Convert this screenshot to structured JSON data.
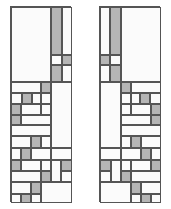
{
  "figure": {
    "type": "diagram",
    "width": 171,
    "height": 209,
    "background_color": "#ffffff",
    "stroke_color": "#555555",
    "fill_white": "#fbfbfb",
    "fill_gray": "#b5b5b5",
    "panel_count": 2
  },
  "panels": [
    {
      "name": "left-panel",
      "label": "Left panel",
      "x": 10,
      "y": 6,
      "width": 61,
      "height": 196,
      "cells": [
        {
          "name": "cell-l-01",
          "x": 0,
          "y": 0,
          "w": 40,
          "h": 75,
          "fill": "white"
        },
        {
          "name": "cell-l-02",
          "x": 40,
          "y": 0,
          "w": 11,
          "h": 48,
          "fill": "gray"
        },
        {
          "name": "cell-l-03",
          "x": 51,
          "y": 0,
          "w": 10,
          "h": 48,
          "fill": "white"
        },
        {
          "name": "cell-l-04",
          "x": 40,
          "y": 48,
          "w": 11,
          "h": 10,
          "fill": "white"
        },
        {
          "name": "cell-l-05",
          "x": 51,
          "y": 48,
          "w": 10,
          "h": 10,
          "fill": "gray"
        },
        {
          "name": "cell-l-06",
          "x": 40,
          "y": 58,
          "w": 11,
          "h": 17,
          "fill": "gray"
        },
        {
          "name": "cell-l-07",
          "x": 51,
          "y": 58,
          "w": 10,
          "h": 17,
          "fill": "white"
        },
        {
          "name": "cell-l-08",
          "x": 0,
          "y": 75,
          "w": 30,
          "h": 11,
          "fill": "white"
        },
        {
          "name": "cell-l-09",
          "x": 30,
          "y": 75,
          "w": 10,
          "h": 11,
          "fill": "gray"
        },
        {
          "name": "cell-l-10",
          "x": 40,
          "y": 75,
          "w": 21,
          "h": 66,
          "fill": "white"
        },
        {
          "name": "cell-l-11",
          "x": 0,
          "y": 86,
          "w": 11,
          "h": 11,
          "fill": "white"
        },
        {
          "name": "cell-l-12",
          "x": 11,
          "y": 86,
          "w": 10,
          "h": 11,
          "fill": "gray"
        },
        {
          "name": "cell-l-13",
          "x": 21,
          "y": 86,
          "w": 9,
          "h": 11,
          "fill": "white"
        },
        {
          "name": "cell-l-14",
          "x": 30,
          "y": 86,
          "w": 10,
          "h": 11,
          "fill": "white"
        },
        {
          "name": "cell-l-15",
          "x": 0,
          "y": 97,
          "w": 10,
          "h": 11,
          "fill": "gray"
        },
        {
          "name": "cell-l-16",
          "x": 10,
          "y": 97,
          "w": 20,
          "h": 11,
          "fill": "white"
        },
        {
          "name": "cell-l-17",
          "x": 30,
          "y": 97,
          "w": 10,
          "h": 11,
          "fill": "white"
        },
        {
          "name": "cell-l-18",
          "x": 0,
          "y": 108,
          "w": 10,
          "h": 10,
          "fill": "gray"
        },
        {
          "name": "cell-l-19",
          "x": 10,
          "y": 108,
          "w": 30,
          "h": 10,
          "fill": "white"
        },
        {
          "name": "cell-l-20",
          "x": 0,
          "y": 118,
          "w": 40,
          "h": 11,
          "fill": "white"
        },
        {
          "name": "cell-l-21",
          "x": 0,
          "y": 129,
          "w": 20,
          "h": 12,
          "fill": "white"
        },
        {
          "name": "cell-l-22",
          "x": 20,
          "y": 129,
          "w": 10,
          "h": 12,
          "fill": "gray"
        },
        {
          "name": "cell-l-23",
          "x": 30,
          "y": 129,
          "w": 10,
          "h": 12,
          "fill": "white"
        },
        {
          "name": "cell-l-24",
          "x": 0,
          "y": 141,
          "w": 10,
          "h": 12,
          "fill": "white"
        },
        {
          "name": "cell-l-25",
          "x": 10,
          "y": 141,
          "w": 10,
          "h": 12,
          "fill": "gray"
        },
        {
          "name": "cell-l-26",
          "x": 20,
          "y": 141,
          "w": 20,
          "h": 12,
          "fill": "white"
        },
        {
          "name": "cell-l-27",
          "x": 40,
          "y": 141,
          "w": 21,
          "h": 12,
          "fill": "white"
        },
        {
          "name": "cell-l-28",
          "x": 0,
          "y": 153,
          "w": 10,
          "h": 11,
          "fill": "gray"
        },
        {
          "name": "cell-l-29",
          "x": 10,
          "y": 153,
          "w": 20,
          "h": 11,
          "fill": "white"
        },
        {
          "name": "cell-l-30",
          "x": 30,
          "y": 153,
          "w": 10,
          "h": 11,
          "fill": "white"
        },
        {
          "name": "cell-l-31",
          "x": 40,
          "y": 153,
          "w": 10,
          "h": 22,
          "fill": "white"
        },
        {
          "name": "cell-l-32",
          "x": 50,
          "y": 153,
          "w": 11,
          "h": 11,
          "fill": "gray"
        },
        {
          "name": "cell-l-33",
          "x": 0,
          "y": 164,
          "w": 30,
          "h": 11,
          "fill": "white"
        },
        {
          "name": "cell-l-34",
          "x": 30,
          "y": 164,
          "w": 10,
          "h": 11,
          "fill": "gray"
        },
        {
          "name": "cell-l-35",
          "x": 50,
          "y": 164,
          "w": 11,
          "h": 11,
          "fill": "white"
        },
        {
          "name": "cell-l-36",
          "x": 0,
          "y": 175,
          "w": 20,
          "h": 12,
          "fill": "white"
        },
        {
          "name": "cell-l-37",
          "x": 20,
          "y": 175,
          "w": 10,
          "h": 12,
          "fill": "gray"
        },
        {
          "name": "cell-l-38",
          "x": 30,
          "y": 175,
          "w": 31,
          "h": 21,
          "fill": "white"
        },
        {
          "name": "cell-l-39",
          "x": 0,
          "y": 187,
          "w": 10,
          "h": 9,
          "fill": "white"
        },
        {
          "name": "cell-l-40",
          "x": 10,
          "y": 187,
          "w": 10,
          "h": 9,
          "fill": "gray"
        },
        {
          "name": "cell-l-41",
          "x": 20,
          "y": 187,
          "w": 10,
          "h": 9,
          "fill": "white"
        }
      ]
    },
    {
      "name": "right-panel",
      "label": "Right panel",
      "x": 99,
      "y": 6,
      "width": 61,
      "height": 196,
      "cells": [
        {
          "name": "cell-r-01",
          "x": 0,
          "y": 0,
          "w": 10,
          "h": 48,
          "fill": "white"
        },
        {
          "name": "cell-r-02",
          "x": 10,
          "y": 0,
          "w": 11,
          "h": 48,
          "fill": "gray"
        },
        {
          "name": "cell-r-03",
          "x": 21,
          "y": 0,
          "w": 40,
          "h": 75,
          "fill": "white"
        },
        {
          "name": "cell-r-04",
          "x": 0,
          "y": 48,
          "w": 10,
          "h": 10,
          "fill": "gray"
        },
        {
          "name": "cell-r-05",
          "x": 10,
          "y": 48,
          "w": 11,
          "h": 10,
          "fill": "white"
        },
        {
          "name": "cell-r-06",
          "x": 0,
          "y": 58,
          "w": 10,
          "h": 17,
          "fill": "white"
        },
        {
          "name": "cell-r-07",
          "x": 10,
          "y": 58,
          "w": 11,
          "h": 17,
          "fill": "gray"
        },
        {
          "name": "cell-r-08",
          "x": 0,
          "y": 75,
          "w": 21,
          "h": 66,
          "fill": "white"
        },
        {
          "name": "cell-r-09",
          "x": 21,
          "y": 75,
          "w": 10,
          "h": 11,
          "fill": "gray"
        },
        {
          "name": "cell-r-10",
          "x": 31,
          "y": 75,
          "w": 30,
          "h": 11,
          "fill": "white"
        },
        {
          "name": "cell-r-11",
          "x": 21,
          "y": 86,
          "w": 10,
          "h": 11,
          "fill": "white"
        },
        {
          "name": "cell-r-12",
          "x": 31,
          "y": 86,
          "w": 9,
          "h": 11,
          "fill": "white"
        },
        {
          "name": "cell-r-13",
          "x": 40,
          "y": 86,
          "w": 10,
          "h": 11,
          "fill": "gray"
        },
        {
          "name": "cell-r-14",
          "x": 50,
          "y": 86,
          "w": 11,
          "h": 11,
          "fill": "white"
        },
        {
          "name": "cell-r-15",
          "x": 21,
          "y": 97,
          "w": 10,
          "h": 11,
          "fill": "white"
        },
        {
          "name": "cell-r-16",
          "x": 31,
          "y": 97,
          "w": 20,
          "h": 11,
          "fill": "white"
        },
        {
          "name": "cell-r-17",
          "x": 51,
          "y": 97,
          "w": 10,
          "h": 11,
          "fill": "gray"
        },
        {
          "name": "cell-r-18",
          "x": 21,
          "y": 108,
          "w": 30,
          "h": 10,
          "fill": "white"
        },
        {
          "name": "cell-r-19",
          "x": 51,
          "y": 108,
          "w": 10,
          "h": 10,
          "fill": "gray"
        },
        {
          "name": "cell-r-20",
          "x": 21,
          "y": 118,
          "w": 40,
          "h": 11,
          "fill": "white"
        },
        {
          "name": "cell-r-21",
          "x": 21,
          "y": 129,
          "w": 10,
          "h": 12,
          "fill": "white"
        },
        {
          "name": "cell-r-22",
          "x": 31,
          "y": 129,
          "w": 10,
          "h": 12,
          "fill": "gray"
        },
        {
          "name": "cell-r-23",
          "x": 41,
          "y": 129,
          "w": 20,
          "h": 12,
          "fill": "white"
        },
        {
          "name": "cell-r-24",
          "x": 0,
          "y": 141,
          "w": 21,
          "h": 12,
          "fill": "white"
        },
        {
          "name": "cell-r-25",
          "x": 21,
          "y": 141,
          "w": 20,
          "h": 12,
          "fill": "white"
        },
        {
          "name": "cell-r-26",
          "x": 41,
          "y": 141,
          "w": 10,
          "h": 12,
          "fill": "gray"
        },
        {
          "name": "cell-r-27",
          "x": 51,
          "y": 141,
          "w": 10,
          "h": 12,
          "fill": "white"
        },
        {
          "name": "cell-r-28",
          "x": 0,
          "y": 153,
          "w": 11,
          "h": 11,
          "fill": "gray"
        },
        {
          "name": "cell-r-29",
          "x": 11,
          "y": 153,
          "w": 10,
          "h": 22,
          "fill": "white"
        },
        {
          "name": "cell-r-30",
          "x": 21,
          "y": 153,
          "w": 10,
          "h": 11,
          "fill": "white"
        },
        {
          "name": "cell-r-31",
          "x": 31,
          "y": 153,
          "w": 20,
          "h": 11,
          "fill": "white"
        },
        {
          "name": "cell-r-32",
          "x": 51,
          "y": 153,
          "w": 10,
          "h": 11,
          "fill": "gray"
        },
        {
          "name": "cell-r-33",
          "x": 0,
          "y": 164,
          "w": 11,
          "h": 11,
          "fill": "white"
        },
        {
          "name": "cell-r-34",
          "x": 21,
          "y": 164,
          "w": 10,
          "h": 11,
          "fill": "gray"
        },
        {
          "name": "cell-r-35",
          "x": 31,
          "y": 164,
          "w": 30,
          "h": 11,
          "fill": "white"
        },
        {
          "name": "cell-r-36",
          "x": 0,
          "y": 175,
          "w": 31,
          "h": 21,
          "fill": "white"
        },
        {
          "name": "cell-r-37",
          "x": 31,
          "y": 175,
          "w": 10,
          "h": 12,
          "fill": "gray"
        },
        {
          "name": "cell-r-38",
          "x": 41,
          "y": 175,
          "w": 20,
          "h": 12,
          "fill": "white"
        },
        {
          "name": "cell-r-39",
          "x": 31,
          "y": 187,
          "w": 10,
          "h": 9,
          "fill": "white"
        },
        {
          "name": "cell-r-40",
          "x": 41,
          "y": 187,
          "w": 10,
          "h": 9,
          "fill": "gray"
        },
        {
          "name": "cell-r-41",
          "x": 51,
          "y": 187,
          "w": 10,
          "h": 9,
          "fill": "white"
        }
      ]
    }
  ]
}
